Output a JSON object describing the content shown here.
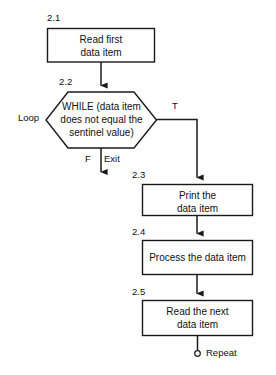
{
  "diagram": {
    "stroke_color": "#1a1a1a",
    "fill_color": "#ffffff",
    "background": "#ffffff",
    "nodes": [
      {
        "id": "2.1",
        "step": "2.1",
        "shape": "process",
        "text": "Read first\ndata item"
      },
      {
        "id": "2.2",
        "step": "2.2",
        "shape": "hexagon",
        "text": "WHILE (data item\ndoes not equal the\nsentinel value)"
      },
      {
        "id": "2.3",
        "step": "2.3",
        "shape": "process",
        "text": "Print the\ndata item"
      },
      {
        "id": "2.4",
        "step": "2.4",
        "shape": "process",
        "text": "Process the data item"
      },
      {
        "id": "2.5",
        "step": "2.5",
        "shape": "process",
        "text": "Read the next\ndata item"
      }
    ],
    "edge_labels": {
      "loop": "Loop",
      "true_branch": "T",
      "false_branch": "F",
      "exit": "Exit",
      "repeat": "Repeat"
    }
  }
}
